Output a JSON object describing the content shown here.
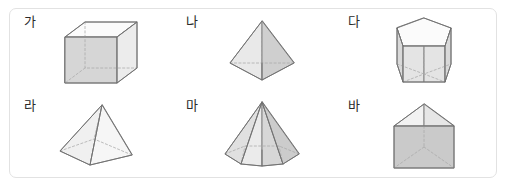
{
  "panel": {
    "name": "solid-figures-panel",
    "border_color": "#e2e2e2",
    "background_color": "#ffffff"
  },
  "style": {
    "face_light": "#f4f4f4",
    "face_mid": "#e2e2e2",
    "face_dark": "#c9c9c9",
    "face_top": "#fbfbfb",
    "edge_visible": "#6f6f6f",
    "edge_hidden": "#a8a8a8",
    "label_color": "#2b2b2b"
  },
  "figures": [
    {
      "label": "가",
      "shape_name": "rectangular-prism",
      "row": 1,
      "column": 1
    },
    {
      "label": "나",
      "shape_name": "triangular-pyramid",
      "row": 1,
      "column": 2
    },
    {
      "label": "다",
      "shape_name": "pentagonal-prism",
      "row": 1,
      "column": 3
    },
    {
      "label": "라",
      "shape_name": "square-pyramid",
      "row": 2,
      "column": 1
    },
    {
      "label": "마",
      "shape_name": "hexagonal-pyramid",
      "row": 2,
      "column": 2
    },
    {
      "label": "바",
      "shape_name": "triangular-prism",
      "row": 2,
      "column": 3
    }
  ]
}
